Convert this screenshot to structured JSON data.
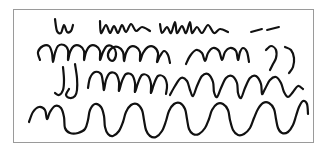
{
  "image": {
    "title": "Hand-drawn scribble lines sketch",
    "width": 329,
    "height": 154,
    "background_color": "#ffffff"
  },
  "frame": {
    "name": "sketch-border-frame",
    "x": 13,
    "y": 9,
    "width": 300,
    "height": 133,
    "stroke_color": "#9a9a9a",
    "stroke_width": 1,
    "fill_color": "#ffffff"
  },
  "ink": {
    "color": "#111111",
    "stroke_width": 2.2,
    "thin_stroke_width": 1.9
  },
  "chart_data": {
    "type": "line",
    "xlabel": "",
    "ylabel": "",
    "grid": false,
    "legend_position": "none",
    "xlim": [
      13,
      313
    ],
    "ylim": [
      9,
      142
    ],
    "series": [
      {
        "name": "row-1-w-glyph",
        "row": 1,
        "description": "small w-shaped mark at left of top row",
        "points": [
          [
            55,
            19
          ],
          [
            57,
            31
          ],
          [
            61,
            33
          ],
          [
            64,
            25
          ],
          [
            67,
            32
          ],
          [
            71,
            31
          ],
          [
            73,
            25
          ]
        ]
      },
      {
        "name": "row-1-zigzag-group",
        "row": 1,
        "description": "hnn-like zigzag cluster in top row",
        "points": [
          [
            100,
            21
          ],
          [
            101,
            33
          ],
          [
            106,
            25
          ],
          [
            110,
            33
          ],
          [
            114,
            26
          ],
          [
            118,
            33
          ],
          [
            122,
            25
          ],
          [
            126,
            32
          ],
          [
            131,
            24
          ],
          [
            136,
            31
          ],
          [
            142,
            27
          ],
          [
            150,
            31
          ]
        ]
      },
      {
        "name": "row-1-zigzag-group-2",
        "row": 1,
        "description": "second zigzag cluster with tall spikes in top row",
        "points": [
          [
            160,
            24
          ],
          [
            162,
            33
          ],
          [
            167,
            27
          ],
          [
            171,
            33
          ],
          [
            175,
            22
          ],
          [
            177,
            33
          ],
          [
            182,
            26
          ],
          [
            186,
            33
          ],
          [
            190,
            22
          ],
          [
            192,
            33
          ],
          [
            197,
            27
          ],
          [
            202,
            33
          ],
          [
            208,
            25
          ],
          [
            214,
            33
          ],
          [
            220,
            29
          ],
          [
            228,
            32
          ]
        ]
      },
      {
        "name": "row-1-dash-1",
        "row": 1,
        "description": "short slanted dash near end of top row",
        "points": [
          [
            251,
            32
          ],
          [
            262,
            29
          ]
        ]
      },
      {
        "name": "row-1-dash-2",
        "row": 1,
        "description": "second short slanted dash at end of top row",
        "points": [
          [
            267,
            30
          ],
          [
            279,
            27
          ]
        ]
      },
      {
        "name": "row-2-left-loops",
        "row": 2,
        "description": "looping arcade humps starting at left of second row",
        "points": [
          [
            40,
            60
          ],
          [
            38,
            52
          ],
          [
            43,
            46
          ],
          [
            49,
            46
          ],
          [
            52,
            53
          ],
          [
            53,
            62
          ],
          [
            55,
            53
          ],
          [
            58,
            46
          ],
          [
            64,
            45
          ],
          [
            68,
            50
          ],
          [
            68,
            60
          ],
          [
            70,
            52
          ],
          [
            74,
            46
          ],
          [
            80,
            46
          ],
          [
            84,
            51
          ],
          [
            84,
            60
          ],
          [
            86,
            52
          ],
          [
            90,
            46
          ],
          [
            96,
            46
          ],
          [
            100,
            51
          ],
          [
            100,
            60
          ],
          [
            103,
            52
          ],
          [
            107,
            46
          ],
          [
            113,
            47
          ],
          [
            116,
            53
          ],
          [
            114,
            60
          ],
          [
            110,
            60
          ],
          [
            108,
            54
          ],
          [
            112,
            48
          ],
          [
            118,
            47
          ],
          [
            123,
            52
          ],
          [
            124,
            61
          ],
          [
            126,
            53
          ],
          [
            130,
            47
          ],
          [
            136,
            47
          ],
          [
            140,
            52
          ],
          [
            140,
            61
          ],
          [
            143,
            53
          ],
          [
            148,
            47
          ],
          [
            154,
            47
          ],
          [
            158,
            53
          ],
          [
            157,
            62
          ],
          [
            160,
            56
          ],
          [
            164,
            51
          ],
          [
            168,
            55
          ],
          [
            170,
            63
          ]
        ]
      },
      {
        "name": "row-2-right-humps",
        "row": 2,
        "description": "smooth humps on right half of second row",
        "points": [
          [
            186,
            64
          ],
          [
            190,
            56
          ],
          [
            196,
            50
          ],
          [
            202,
            53
          ],
          [
            205,
            61
          ],
          [
            208,
            53
          ],
          [
            213,
            48
          ],
          [
            219,
            51
          ],
          [
            222,
            60
          ],
          [
            225,
            52
          ],
          [
            230,
            48
          ],
          [
            236,
            51
          ],
          [
            238,
            60
          ],
          [
            240,
            52
          ],
          [
            243,
            48
          ],
          [
            247,
            52
          ],
          [
            249,
            62
          ]
        ]
      },
      {
        "name": "row-2-paren-stroke-1",
        "row": 2,
        "description": "curved parenthesis-like stroke at right of second row",
        "points": [
          [
            266,
            50
          ],
          [
            271,
            46
          ],
          [
            276,
            50
          ],
          [
            276,
            58
          ],
          [
            273,
            64
          ],
          [
            270,
            70
          ]
        ]
      },
      {
        "name": "row-2-paren-stroke-2",
        "row": 2,
        "description": "second curved parenthesis-like stroke at right of second row",
        "points": [
          [
            285,
            47
          ],
          [
            291,
            50
          ],
          [
            294,
            58
          ],
          [
            293,
            67
          ],
          [
            289,
            73
          ]
        ]
      },
      {
        "name": "row-3-descender-1",
        "row": 3,
        "description": "j-like descender stroke at left of third row",
        "points": [
          [
            63,
            67
          ],
          [
            64,
            80
          ],
          [
            63,
            90
          ],
          [
            59,
            95
          ],
          [
            55,
            93
          ]
        ]
      },
      {
        "name": "row-3-descender-2",
        "row": 3,
        "description": "second j-like descender with hook at left of third row",
        "points": [
          [
            75,
            64
          ],
          [
            77,
            78
          ],
          [
            77,
            90
          ],
          [
            75,
            96
          ],
          [
            70,
            98
          ],
          [
            66,
            95
          ],
          [
            69,
            89
          ]
        ]
      },
      {
        "name": "row-3-humps-left",
        "row": 3,
        "description": "rounded square humps in middle-left of third row",
        "points": [
          [
            88,
            88
          ],
          [
            90,
            78
          ],
          [
            95,
            72
          ],
          [
            101,
            74
          ],
          [
            103,
            83
          ],
          [
            104,
            90
          ],
          [
            106,
            80
          ],
          [
            110,
            73
          ],
          [
            116,
            74
          ],
          [
            119,
            82
          ],
          [
            119,
            91
          ],
          [
            122,
            81
          ],
          [
            126,
            74
          ],
          [
            132,
            75
          ],
          [
            135,
            83
          ],
          [
            135,
            92
          ],
          [
            138,
            83
          ],
          [
            142,
            75
          ],
          [
            148,
            76
          ],
          [
            151,
            84
          ],
          [
            151,
            93
          ],
          [
            154,
            84
          ],
          [
            158,
            76
          ],
          [
            164,
            77
          ],
          [
            167,
            85
          ],
          [
            166,
            94
          ]
        ]
      },
      {
        "name": "row-3-peaks-right",
        "row": 3,
        "description": "tall pointed waves on right half of third row",
        "points": [
          [
            170,
            95
          ],
          [
            175,
            86
          ],
          [
            181,
            78
          ],
          [
            187,
            81
          ],
          [
            190,
            90
          ],
          [
            193,
            96
          ],
          [
            197,
            86
          ],
          [
            202,
            76
          ],
          [
            208,
            74
          ],
          [
            213,
            82
          ],
          [
            214,
            92
          ],
          [
            217,
            97
          ],
          [
            221,
            88
          ],
          [
            226,
            78
          ],
          [
            232,
            76
          ],
          [
            237,
            83
          ],
          [
            238,
            93
          ],
          [
            241,
            98
          ],
          [
            245,
            88
          ],
          [
            250,
            78
          ],
          [
            256,
            76
          ],
          [
            261,
            84
          ],
          [
            262,
            94
          ],
          [
            265,
            89
          ],
          [
            270,
            80
          ],
          [
            276,
            77
          ],
          [
            281,
            83
          ],
          [
            284,
            92
          ],
          [
            288,
            97
          ],
          [
            293,
            92
          ],
          [
            298,
            86
          ],
          [
            303,
            89
          ]
        ]
      },
      {
        "name": "row-4-bottom-wave",
        "row": 4,
        "description": "large smooth sine-like wave forming the bottom row",
        "points": [
          [
            29,
            122
          ],
          [
            33,
            112
          ],
          [
            39,
            107
          ],
          [
            45,
            110
          ],
          [
            47,
            119
          ],
          [
            50,
            112
          ],
          [
            55,
            106
          ],
          [
            61,
            108
          ],
          [
            64,
            117
          ],
          [
            65,
            128
          ],
          [
            70,
            133
          ],
          [
            78,
            133
          ],
          [
            85,
            129
          ],
          [
            88,
            120
          ],
          [
            90,
            110
          ],
          [
            95,
            104
          ],
          [
            101,
            107
          ],
          [
            104,
            116
          ],
          [
            105,
            127
          ],
          [
            108,
            134
          ],
          [
            113,
            136
          ],
          [
            119,
            131
          ],
          [
            123,
            122
          ],
          [
            126,
            112
          ],
          [
            131,
            105
          ],
          [
            137,
            104
          ],
          [
            142,
            110
          ],
          [
            144,
            120
          ],
          [
            146,
            130
          ],
          [
            150,
            136
          ],
          [
            156,
            137
          ],
          [
            162,
            131
          ],
          [
            166,
            121
          ],
          [
            169,
            111
          ],
          [
            174,
            104
          ],
          [
            180,
            103
          ],
          [
            185,
            109
          ],
          [
            187,
            119
          ],
          [
            189,
            129
          ],
          [
            193,
            134
          ],
          [
            199,
            134
          ],
          [
            205,
            128
          ],
          [
            209,
            119
          ],
          [
            212,
            110
          ],
          [
            217,
            104
          ],
          [
            223,
            104
          ],
          [
            228,
            110
          ],
          [
            230,
            120
          ],
          [
            233,
            130
          ],
          [
            238,
            135
          ],
          [
            244,
            134
          ],
          [
            250,
            128
          ],
          [
            254,
            118
          ],
          [
            258,
            109
          ],
          [
            263,
            103
          ],
          [
            269,
            103
          ],
          [
            274,
            109
          ],
          [
            276,
            119
          ],
          [
            278,
            128
          ],
          [
            282,
            133
          ],
          [
            288,
            132
          ],
          [
            293,
            125
          ],
          [
            296,
            116
          ],
          [
            299,
            107
          ],
          [
            303,
            101
          ],
          [
            307,
            104
          ],
          [
            308,
            114
          ]
        ]
      }
    ]
  }
}
